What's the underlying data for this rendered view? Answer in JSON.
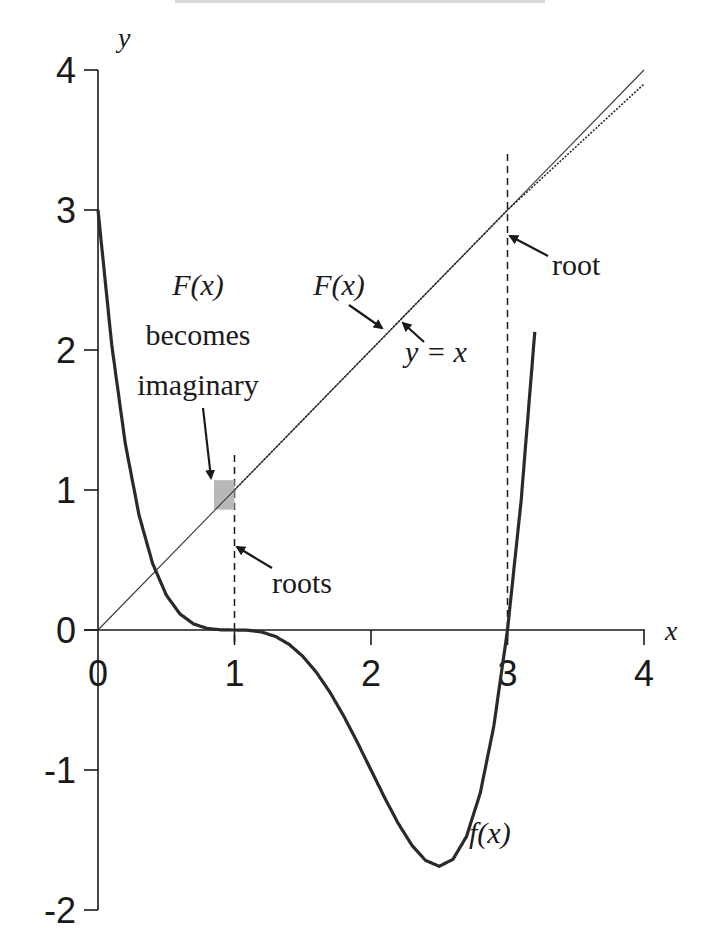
{
  "chart_data": {
    "type": "line",
    "title": "",
    "xlabel": "x",
    "ylabel": "y",
    "xlim": [
      0,
      4
    ],
    "ylim": [
      -2,
      4
    ],
    "x_ticks": [
      0,
      1,
      2,
      3,
      4
    ],
    "y_ticks": [
      -2,
      -1,
      0,
      1,
      2,
      3,
      4
    ],
    "x_tick_labels": [
      "0",
      "1",
      "2",
      "3",
      "4"
    ],
    "y_tick_labels": [
      "-2",
      "-1",
      "0",
      "1",
      "2",
      "3",
      "4"
    ],
    "grid": false,
    "legend": "none",
    "series": [
      {
        "name": "f(x)",
        "style": "thick solid",
        "x": [
          0,
          0.1,
          0.2,
          0.3,
          0.4,
          0.5,
          0.6,
          0.7,
          0.8,
          0.9,
          1.0,
          1.1,
          1.2,
          1.3,
          1.4,
          1.5,
          1.6,
          1.7,
          1.8,
          1.9,
          2.0,
          2.1,
          2.2,
          2.3,
          2.4,
          2.5,
          2.6,
          2.7,
          2.8,
          2.9,
          3.0,
          3.1,
          3.2
        ],
        "y": [
          3.0,
          2.0412,
          1.3312,
          0.8232,
          0.4752,
          0.25,
          0.1152,
          0.0432,
          0.0112,
          0.0014,
          0.0,
          -0.0019,
          -0.0144,
          -0.0459,
          -0.1024,
          -0.1875,
          -0.3024,
          -0.4459,
          -0.6144,
          -0.8019,
          -1.0,
          -1.1979,
          -1.3824,
          -1.5379,
          -1.6464,
          -1.6875,
          -1.6384,
          -1.4739,
          -1.1664,
          -0.6859,
          0.0,
          0.9261,
          2.1296
        ]
      },
      {
        "name": "y = x",
        "style": "thin solid",
        "x": [
          0,
          4
        ],
        "y": [
          0,
          4
        ]
      },
      {
        "name": "F(x)",
        "style": "thin dotted",
        "x": [
          1.0,
          2.0,
          3.0,
          4.0
        ],
        "y": [
          1.0,
          2.0,
          3.0,
          3.9
        ]
      }
    ],
    "annotations": [
      {
        "text": "F(x) becomes imaginary",
        "points_to": [
          0.9,
          0.9
        ]
      },
      {
        "text": "roots",
        "points_to": [
          1.0,
          0.6
        ]
      },
      {
        "text": "root",
        "points_to": [
          3.0,
          2.8
        ]
      },
      {
        "text": "F(x)",
        "points_to": [
          2.1,
          2.2
        ]
      },
      {
        "text": "y = x",
        "points_to": [
          2.2,
          2.2
        ]
      },
      {
        "text": "f(x)",
        "points_to": [
          2.6,
          -1.6
        ]
      }
    ],
    "vertical_dashed_lines": [
      {
        "x": 1,
        "y_from": 0,
        "y_to": 1.25
      },
      {
        "x": 3,
        "y_from": 0,
        "y_to": 3.4
      }
    ],
    "highlight_region": {
      "x": [
        0.85,
        1.0
      ],
      "y": [
        0.86,
        1.07
      ],
      "color": "#b8b8b8"
    }
  },
  "labels": {
    "y_axis": "y",
    "x_axis": "x",
    "F_left": "F(x)",
    "becomes": "becomes",
    "imaginary": "imaginary",
    "F_mid": "F(x)",
    "y_eq_x": "y = x",
    "root": "root",
    "roots": "roots",
    "f_label": "f(x)"
  },
  "colors": {
    "ink": "#1a1a1a",
    "highlight": "#b8b8b8"
  }
}
